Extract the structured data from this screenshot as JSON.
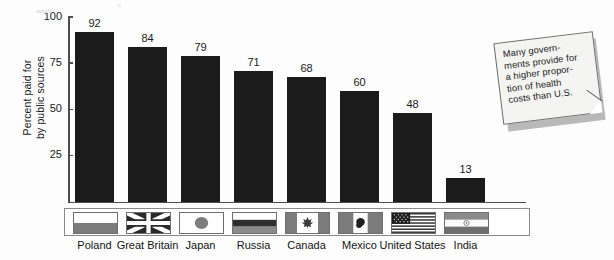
{
  "chart_data": {
    "type": "bar",
    "title": "",
    "xlabel": "",
    "ylabel": "Percent paid for\nby public sources",
    "ylim": [
      0,
      100
    ],
    "yticks": [
      "100",
      "75",
      "50",
      "25"
    ],
    "ytick_values": [
      100,
      75,
      50,
      25
    ],
    "grid": false,
    "legend": "flag-strip",
    "categories": [
      "Poland",
      "Great Britain",
      "Japan",
      "Russia",
      "Canada",
      "Mexico",
      "United States",
      "India"
    ],
    "values": [
      92,
      84,
      79,
      71,
      68,
      60,
      48,
      13
    ],
    "value_labels": [
      "92",
      "84",
      "79",
      "71",
      "68",
      "60",
      "48",
      "13"
    ],
    "flags": [
      "poland-flag",
      "great-britain-flag",
      "japan-flag",
      "russia-flag",
      "canada-flag",
      "mexico-flag",
      "united-states-flag",
      "india-flag"
    ],
    "annotations": [
      {
        "name": "callout-note",
        "text": "Many govern-\nments provide for\na higher propor-\ntion of health\ncosts than U.S."
      }
    ]
  },
  "colors": {
    "bar": "#1b1b1b",
    "axis": "#4d4d4d",
    "text": "#1a1a1a",
    "background": "#fdfdfd",
    "note_paper": "#f4f4f2",
    "note_border": "#6e6e6e",
    "flag_border": "#6f6f6f"
  }
}
